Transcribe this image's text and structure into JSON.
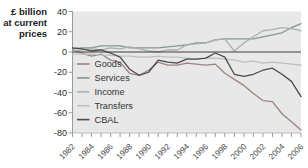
{
  "chart_data": {
    "type": "line",
    "title": "",
    "y_axis_title": "£ billion\nat current\nprices",
    "xlabel": "",
    "ylabel": "£ billion at current prices",
    "x": [
      1982,
      1983,
      1984,
      1985,
      1986,
      1987,
      1988,
      1989,
      1990,
      1991,
      1992,
      1993,
      1994,
      1995,
      1996,
      1997,
      1998,
      1999,
      2000,
      2001,
      2002,
      2003,
      2004,
      2005,
      2006
    ],
    "x_tick_labels": [
      "1982",
      "1984",
      "1986",
      "1988",
      "1990",
      "1992",
      "1994",
      "1996",
      "1998",
      "2000",
      "2002",
      "2004",
      "2006"
    ],
    "y_ticks": [
      40,
      20,
      0,
      -20,
      -40,
      -60,
      -80
    ],
    "ylim": [
      -80,
      40
    ],
    "xlim": [
      1982,
      2006
    ],
    "grid": false,
    "legend_position": "inside-left-below-zero",
    "plot_bg": "#e8e8e8",
    "zero_line_color": "#3a3a3a",
    "axis_color": "#9a9a9a",
    "series": [
      {
        "name": "Goods",
        "color": "#9e8280",
        "values": [
          2,
          -1,
          -4,
          -2,
          -8,
          -10,
          -21,
          -23,
          -18,
          -10,
          -13,
          -13,
          -11,
          -12,
          -13,
          -12,
          -21,
          -27,
          -33,
          -41,
          -48,
          -49,
          -61,
          -69,
          -77
        ]
      },
      {
        "name": "Services",
        "color": "#85988f",
        "values": [
          3,
          4,
          4,
          6,
          6,
          6,
          4,
          4,
          4,
          4,
          5,
          6,
          7,
          9,
          9,
          12,
          13,
          13,
          13,
          13,
          15,
          17,
          19,
          24,
          28
        ]
      },
      {
        "name": "Income",
        "color": "#a9b2a7",
        "values": [
          1,
          2,
          3,
          2,
          4,
          3,
          5,
          3,
          1,
          0,
          2,
          2,
          7,
          8,
          9,
          12,
          13,
          1,
          9,
          15,
          21,
          22,
          24,
          23,
          21
        ]
      },
      {
        "name": "Transfers",
        "color": "#babfc3",
        "values": [
          -2,
          -2,
          -2,
          -3,
          -3,
          -4,
          -4,
          -5,
          -5,
          -4,
          -5,
          -5,
          -6,
          -7,
          -6,
          -6,
          -7,
          -8,
          -10,
          -9,
          -11,
          -10,
          -11,
          -12,
          -13
        ]
      },
      {
        "name": "CBAL",
        "color": "#4a4a4a",
        "values": [
          4,
          3,
          1,
          2,
          -1,
          -5,
          -17,
          -23,
          -20,
          -8,
          -10,
          -11,
          -7,
          -7,
          -6,
          -1,
          -5,
          -22,
          -24,
          -22,
          -18,
          -16,
          -22,
          -29,
          -44
        ]
      }
    ]
  }
}
